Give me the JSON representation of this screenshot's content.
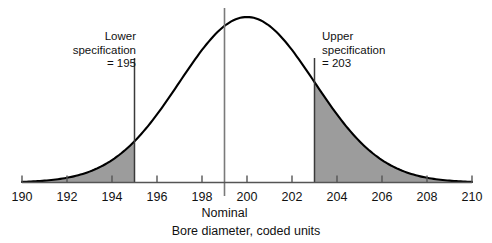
{
  "chart_data": {
    "type": "area",
    "title": "",
    "xlabel": "Bore diameter, coded units",
    "ylabel": "",
    "xlim": [
      190,
      210
    ],
    "ylim": [
      0,
      1
    ],
    "grid": false,
    "legend_position": "none",
    "x_ticks": [
      190,
      192,
      194,
      196,
      198,
      200,
      202,
      204,
      206,
      208,
      210
    ],
    "x_tick_labels": [
      "190",
      "192",
      "194",
      "196",
      "198",
      "200",
      "202",
      "204",
      "206",
      "208",
      "210"
    ],
    "distribution": {
      "name": "Normal density of bore diameter",
      "mean": 200,
      "std_dev": 3,
      "x": [
        190,
        191,
        192,
        193,
        194,
        195,
        196,
        197,
        198,
        199,
        200,
        201,
        202,
        203,
        204,
        205,
        206,
        207,
        208,
        209,
        210
      ],
      "density": [
        0.004,
        0.014,
        0.038,
        0.088,
        0.169,
        0.264,
        0.368,
        0.459,
        0.513,
        0.513,
        0.513,
        0.513,
        0.459,
        0.368,
        0.264,
        0.169,
        0.088,
        0.038,
        0.014,
        0.004,
        0.001
      ],
      "values_normalized": [
        0.008,
        0.027,
        0.074,
        0.172,
        0.329,
        0.513,
        0.717,
        0.895,
        1.0,
        1.0,
        1.0,
        1.0,
        0.895,
        0.717,
        0.513,
        0.329,
        0.172,
        0.074,
        0.027,
        0.008,
        0.002
      ]
    },
    "annotations": [
      {
        "name": "lower-specification",
        "label": "Lower\nspecification\n= 195",
        "value": 195,
        "line": "vertical"
      },
      {
        "name": "nominal",
        "label": "Nominal",
        "value": 199,
        "line": "vertical"
      },
      {
        "name": "upper-specification",
        "label": "Upper\nspecification\n= 203",
        "value": 203,
        "line": "vertical"
      }
    ],
    "shaded_regions": [
      {
        "name": "lower-tail-out-of-spec",
        "from": 190,
        "to": 195,
        "color": "#9c9c9c"
      },
      {
        "name": "upper-tail-out-of-spec",
        "from": 203,
        "to": 210,
        "color": "#9c9c9c"
      }
    ]
  },
  "annotations": {
    "lower_spec": "Lower\nspecification\n= 195",
    "upper_spec": "Upper\nspecification\n= 203",
    "nominal": "Nominal"
  },
  "axis": {
    "title": "Bore diameter, coded units",
    "ticks": [
      "190",
      "192",
      "194",
      "196",
      "198",
      "200",
      "202",
      "204",
      "206",
      "208",
      "210"
    ]
  },
  "colors": {
    "curve": "#000000",
    "shade": "#9c9c9c",
    "axis": "#555555",
    "spec_line": "#3a3a3a",
    "nominal_line": "#7a7a7a",
    "text": "#111111"
  }
}
